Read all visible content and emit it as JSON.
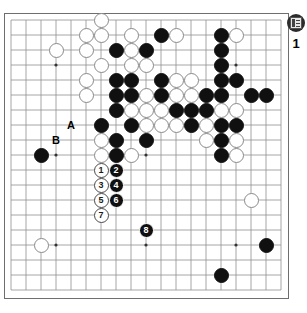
{
  "diagram": {
    "type": "go-board-diagram",
    "board_size": 19,
    "colors": {
      "black_stone": "#101010",
      "white_stone": "#ffffff",
      "grid_line": "#8f8f8f",
      "board_border": "#6e6e6e",
      "background": "#ffffff",
      "label_text": "#000000"
    },
    "geometry": {
      "origin_x": 11,
      "origin_y": 20,
      "cell": 15,
      "stone_diameter": 15
    }
  },
  "corner_widget": {
    "icon": "document-list-icon",
    "count": "1"
  },
  "coordinate_labels": [
    {
      "text": "A",
      "col": 4,
      "row": 7
    },
    {
      "text": "B",
      "col": 3,
      "row": 8
    }
  ],
  "star_points": [
    {
      "col": 3,
      "row": 3
    },
    {
      "col": 9,
      "row": 3
    },
    {
      "col": 15,
      "row": 3
    },
    {
      "col": 3,
      "row": 9
    },
    {
      "col": 9,
      "row": 9
    },
    {
      "col": 15,
      "row": 9
    },
    {
      "col": 3,
      "row": 15
    },
    {
      "col": 9,
      "row": 15
    },
    {
      "col": 15,
      "row": 15
    }
  ],
  "move_stones": [
    {
      "number": "1",
      "color": "white",
      "col": 6,
      "row": 10
    },
    {
      "number": "2",
      "color": "black",
      "col": 7,
      "row": 10
    },
    {
      "number": "3",
      "color": "white",
      "col": 6,
      "row": 11
    },
    {
      "number": "4",
      "color": "black",
      "col": 7,
      "row": 11
    },
    {
      "number": "5",
      "color": "white",
      "col": 6,
      "row": 12
    },
    {
      "number": "6",
      "color": "black",
      "col": 7,
      "row": 12
    },
    {
      "number": "7",
      "color": "white",
      "col": 6,
      "row": 13
    },
    {
      "number": "8",
      "color": "black",
      "col": 9,
      "row": 14
    }
  ],
  "black_stones": [
    {
      "col": 2,
      "row": 9
    },
    {
      "col": 6,
      "row": 7
    },
    {
      "col": 7,
      "row": 2
    },
    {
      "col": 7,
      "row": 4
    },
    {
      "col": 7,
      "row": 5
    },
    {
      "col": 7,
      "row": 6
    },
    {
      "col": 7,
      "row": 8
    },
    {
      "col": 7,
      "row": 9
    },
    {
      "col": 8,
      "row": 4
    },
    {
      "col": 8,
      "row": 5
    },
    {
      "col": 8,
      "row": 7
    },
    {
      "col": 9,
      "row": 2
    },
    {
      "col": 9,
      "row": 8
    },
    {
      "col": 10,
      "row": 1
    },
    {
      "col": 10,
      "row": 4
    },
    {
      "col": 10,
      "row": 5
    },
    {
      "col": 11,
      "row": 6
    },
    {
      "col": 12,
      "row": 6
    },
    {
      "col": 12,
      "row": 7
    },
    {
      "col": 13,
      "row": 5
    },
    {
      "col": 13,
      "row": 6
    },
    {
      "col": 14,
      "row": 1
    },
    {
      "col": 14,
      "row": 2
    },
    {
      "col": 14,
      "row": 3
    },
    {
      "col": 14,
      "row": 4
    },
    {
      "col": 14,
      "row": 5
    },
    {
      "col": 14,
      "row": 7
    },
    {
      "col": 14,
      "row": 8
    },
    {
      "col": 14,
      "row": 9
    },
    {
      "col": 15,
      "row": 4
    },
    {
      "col": 15,
      "row": 7
    },
    {
      "col": 16,
      "row": 5
    },
    {
      "col": 17,
      "row": 5
    },
    {
      "col": 14,
      "row": 17
    },
    {
      "col": 17,
      "row": 15
    }
  ],
  "white_stones": [
    {
      "col": 3,
      "row": 2
    },
    {
      "col": 5,
      "row": 1
    },
    {
      "col": 5,
      "row": 2
    },
    {
      "col": 5,
      "row": 4
    },
    {
      "col": 5,
      "row": 5
    },
    {
      "col": 6,
      "row": 0
    },
    {
      "col": 6,
      "row": 1
    },
    {
      "col": 6,
      "row": 3
    },
    {
      "col": 6,
      "row": 8
    },
    {
      "col": 6,
      "row": 9
    },
    {
      "col": 8,
      "row": 1
    },
    {
      "col": 8,
      "row": 2
    },
    {
      "col": 8,
      "row": 3
    },
    {
      "col": 8,
      "row": 6
    },
    {
      "col": 8,
      "row": 9
    },
    {
      "col": 9,
      "row": 3
    },
    {
      "col": 9,
      "row": 5
    },
    {
      "col": 9,
      "row": 6
    },
    {
      "col": 9,
      "row": 7
    },
    {
      "col": 10,
      "row": 6
    },
    {
      "col": 10,
      "row": 7
    },
    {
      "col": 11,
      "row": 1
    },
    {
      "col": 11,
      "row": 4
    },
    {
      "col": 11,
      "row": 5
    },
    {
      "col": 11,
      "row": 7
    },
    {
      "col": 12,
      "row": 4
    },
    {
      "col": 12,
      "row": 5
    },
    {
      "col": 13,
      "row": 7
    },
    {
      "col": 13,
      "row": 8
    },
    {
      "col": 14,
      "row": 6
    },
    {
      "col": 15,
      "row": 1
    },
    {
      "col": 15,
      "row": 6
    },
    {
      "col": 15,
      "row": 8
    },
    {
      "col": 15,
      "row": 9
    },
    {
      "col": 2,
      "row": 15
    },
    {
      "col": 16,
      "row": 12
    }
  ]
}
